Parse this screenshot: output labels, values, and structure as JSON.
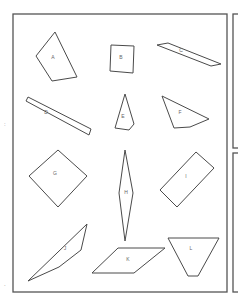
{
  "diagram": {
    "title": "",
    "frame_color": "#555555",
    "stroke_color": "#4a4a4a",
    "label_color": "#666666",
    "side_marks": [
      {
        "text": ":",
        "x": 4,
        "y": 126
      },
      {
        "text": ".",
        "x": 4,
        "y": 286
      }
    ],
    "shapes": [
      {
        "label": "A",
        "kind": "quadrilateral",
        "points": "36,56 55,32 77,77 52,81",
        "lx": 53,
        "ly": 58
      },
      {
        "label": "B",
        "kind": "square",
        "points": "111,45 134,46 133,73 110,71",
        "lx": 121,
        "ly": 58
      },
      {
        "label": "C",
        "kind": "parallelogram",
        "points": "157,45 168,43 221,64 211,66",
        "lx": 181,
        "ly": 51
      },
      {
        "label": "D",
        "kind": "rectangle",
        "points": "26,101 28,97 91,129 89,135",
        "lx": 46,
        "ly": 113
      },
      {
        "label": "E",
        "kind": "kite",
        "points": "125,94 134,124 129,130 115,128",
        "lx": 123,
        "ly": 117
      },
      {
        "label": "F",
        "kind": "quadrilateral",
        "points": "162,96 209,119 190,127 174,128",
        "lx": 180,
        "ly": 113
      },
      {
        "label": "G",
        "kind": "square",
        "points": "58,150 87,176 58,207 29,176",
        "lx": 55,
        "ly": 174
      },
      {
        "label": "H",
        "kind": "rhombus",
        "points": "125,150 133,193 125,241 119,193",
        "lx": 126,
        "ly": 193
      },
      {
        "label": "I",
        "kind": "rectangle",
        "points": "196,152 214,168 177,207 160,190",
        "lx": 186,
        "ly": 177
      },
      {
        "label": "J",
        "kind": "triangle",
        "points": "87,224 81,250 59,267 28,281",
        "lx": 65,
        "ly": 249
      },
      {
        "label": "K",
        "kind": "parallelogram",
        "points": "118,248 165,248 134,273 92,273",
        "lx": 128,
        "ly": 260
      },
      {
        "label": "L",
        "kind": "trapezoid",
        "points": "168,238 219,238 198,276 188,276",
        "lx": 191,
        "ly": 249
      }
    ]
  }
}
